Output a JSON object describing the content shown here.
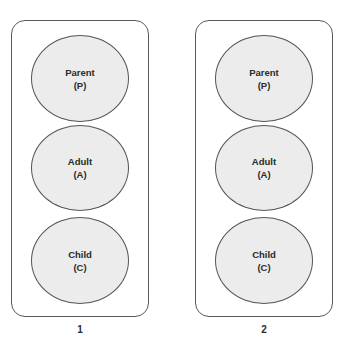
{
  "diagram": {
    "panels": [
      {
        "caption": "1",
        "states": [
          {
            "name": "Parent",
            "abbr": "(P)"
          },
          {
            "name": "Adult",
            "abbr": "(A)"
          },
          {
            "name": "Child",
            "abbr": "(C)"
          }
        ]
      },
      {
        "caption": "2",
        "states": [
          {
            "name": "Parent",
            "abbr": "(P)"
          },
          {
            "name": "Adult",
            "abbr": "(A)"
          },
          {
            "name": "Child",
            "abbr": "(C)"
          }
        ]
      }
    ],
    "colors": {
      "circle_fill": "#ececec",
      "stroke": "#555555",
      "text": "#2a2a2a"
    }
  }
}
